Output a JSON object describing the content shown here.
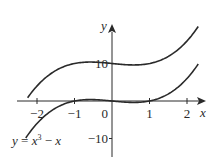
{
  "chart_data": {
    "type": "line",
    "title": "",
    "xlabel": "x",
    "ylabel": "y",
    "xlim": [
      -2.3,
      2.3
    ],
    "ylim": [
      -15,
      20
    ],
    "grid": false,
    "x_ticks": [
      {
        "value": -2,
        "label": "−2"
      },
      {
        "value": -1,
        "label": "−1"
      },
      {
        "value": 1,
        "label": "1"
      },
      {
        "value": 2,
        "label": "2"
      }
    ],
    "y_ticks": [
      {
        "value": 10,
        "label": "10"
      },
      {
        "value": -10,
        "label": "−10"
      }
    ],
    "origin_label": "0",
    "series": [
      {
        "name": "upper",
        "formula": "x^3 - x + 10",
        "shift": 10,
        "x_range": [
          -2.25,
          2.3
        ]
      },
      {
        "name": "lower",
        "formula": "x^3 - x",
        "shift": 0,
        "x_range": [
          -2.3,
          2.3
        ]
      }
    ],
    "annotations": [
      {
        "text_y": "y",
        "text_eq": " = ",
        "text_x": "x",
        "text_exp": "3",
        "text_minus": " − ",
        "text_x2": "x",
        "attached_to": "lower",
        "placement": "bottom-left"
      }
    ]
  }
}
